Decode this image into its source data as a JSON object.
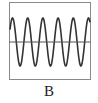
{
  "figure": {
    "label": "B",
    "frame": {
      "x": 9.5,
      "y": 2.5,
      "width": 81,
      "height": 77,
      "stroke": "#8a8a8a"
    },
    "axis": {
      "y": 42,
      "stroke": "#555555"
    },
    "wave": {
      "type": "sine",
      "cycles_visible": 5.3,
      "period_px": 15.2,
      "amplitude_px": 24,
      "first_peak_x": 12.5,
      "midline_y": 42,
      "stroke": "#333333"
    }
  }
}
